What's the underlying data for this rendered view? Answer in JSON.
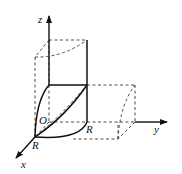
{
  "figure": {
    "type": "3D coordinate diagram: intersection of two perpendicular cylinders of radius R (one octant)",
    "labels": {
      "z_axis": "z",
      "y_axis": "y",
      "x_axis": "x",
      "origin": "O",
      "r_on_x": "R",
      "r_on_y": "R"
    },
    "colors": {
      "stroke": "#111111",
      "background": "#ffffff"
    }
  }
}
